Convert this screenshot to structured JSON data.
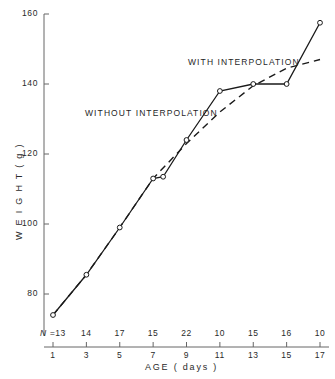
{
  "chart_data": {
    "type": "line",
    "title": "",
    "xlabel": "AGE  ( days )",
    "ylabel": "W E I G H T   ( g )",
    "xlim": [
      0,
      18
    ],
    "ylim": [
      70,
      162
    ],
    "grid": false,
    "legend_position": "inline-annotations",
    "x": [
      1,
      3,
      5,
      7,
      8,
      9,
      11,
      13,
      15,
      17
    ],
    "xticks": [
      1,
      3,
      5,
      7,
      9,
      11,
      13,
      15,
      17
    ],
    "xtick_labels": [
      "1",
      "3",
      "5",
      "7",
      "9",
      "11",
      "13",
      "15",
      "17"
    ],
    "yticks": [
      80,
      100,
      120,
      140,
      160
    ],
    "ytick_labels": [
      "80",
      "100",
      "120",
      "140",
      "160"
    ],
    "series": [
      {
        "name": "WITHOUT INTERPOLATION",
        "style": "solid",
        "marker": "open-circle",
        "x": [
          1,
          3,
          5,
          7,
          7.6,
          9,
          11,
          13,
          15,
          17
        ],
        "values": [
          74.0,
          85.5,
          99.0,
          113.0,
          113.5,
          124.0,
          138.0,
          140.0,
          140.0,
          157.5
        ]
      },
      {
        "name": "WITH INTERPOLATION",
        "style": "dashed",
        "marker": "none",
        "x": [
          1,
          3,
          5,
          7,
          9,
          11,
          13,
          15,
          17
        ],
        "values": [
          74.0,
          85.5,
          99.0,
          113.0,
          123.0,
          132.0,
          139.5,
          144.5,
          147.0
        ]
      }
    ],
    "annotations": [
      {
        "text": "WITH INTERPOLATION",
        "x_px": 188,
        "y_px": 57
      },
      {
        "text": "WITHOUT INTERPOLATION",
        "x_px": 85,
        "y_px": 108
      }
    ],
    "sample_sizes": {
      "prefix": "N =",
      "counts": [
        13,
        14,
        17,
        15,
        22,
        10,
        15,
        16,
        10
      ]
    },
    "colors": {
      "axis": "#555555",
      "solid_line": "#1a1a1a",
      "dashed_line": "#1a1a1a",
      "marker_fill": "#ffffff",
      "text": "#2a2a2a",
      "background": "#ffffff"
    }
  }
}
